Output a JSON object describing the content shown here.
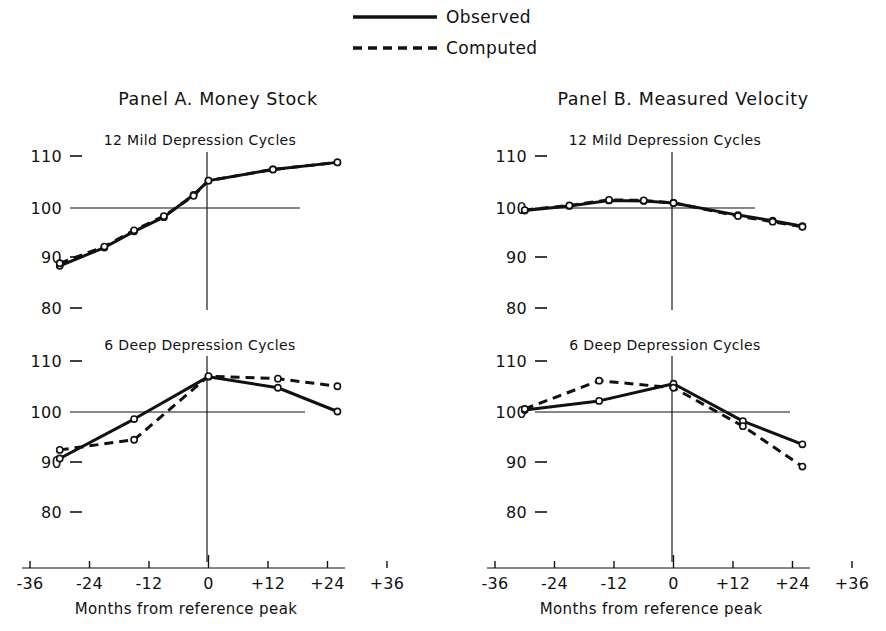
{
  "figure": {
    "legend": {
      "position": "top-center",
      "entries": [
        {
          "label": "Observed",
          "style": "solid"
        },
        {
          "label": "Computed",
          "style": "dashed"
        }
      ]
    },
    "panels": [
      {
        "id": "A",
        "title": "Panel A.  Money Stock"
      },
      {
        "id": "B",
        "title": "Panel B.  Measured Velocity"
      }
    ],
    "axis": {
      "xlabel": "Months from reference peak",
      "xticks": [
        "-36",
        "-24",
        "-12",
        "0",
        "+12",
        "+24",
        "+36"
      ],
      "xtick_values": [
        -36,
        -24,
        -12,
        0,
        12,
        24,
        36
      ],
      "yticks": [
        "110",
        "100",
        "90",
        "80"
      ],
      "ytick_values": [
        110,
        100,
        90,
        80
      ],
      "ylim": [
        75,
        114
      ],
      "xlim": [
        -36,
        36
      ],
      "reference_level": 100,
      "grid": false
    },
    "colors": {
      "ink": "#111111",
      "background": "#ffffff",
      "marker_fill": "#ffffff"
    }
  },
  "chart_data": [
    {
      "id": "panelA-mild",
      "type": "line",
      "panel": "Panel A.  Money Stock",
      "title": "12 Mild Depression Cycles",
      "xlabel": "Months from reference peak",
      "ylabel": "",
      "xlim": [
        -36,
        36
      ],
      "ylim": [
        75,
        114
      ],
      "xticks": [
        -36,
        -24,
        -12,
        0,
        12,
        24,
        36
      ],
      "yticks": [
        110,
        100,
        90,
        80
      ],
      "grid": false,
      "reference_level": 100,
      "series": [
        {
          "name": "Observed",
          "style": "solid",
          "x": [
            -30,
            -21,
            -15,
            -9,
            -3,
            0,
            13,
            26
          ],
          "values": [
            88.6,
            92.2,
            95.4,
            98.2,
            102.6,
            105.4,
            107.6,
            109.0
          ]
        },
        {
          "name": "Computed",
          "style": "dashed",
          "x": [
            -30,
            -21,
            -15,
            -9,
            -3,
            0,
            13,
            26
          ],
          "values": [
            89.1,
            92.4,
            95.6,
            98.4,
            102.4,
            105.4,
            107.6,
            109.0
          ]
        }
      ]
    },
    {
      "id": "panelA-deep",
      "type": "line",
      "panel": "Panel A.  Money Stock",
      "title": "6 Deep Depression Cycles",
      "xlabel": "Months from reference peak",
      "ylabel": "",
      "xlim": [
        -36,
        36
      ],
      "ylim": [
        75,
        114
      ],
      "xticks": [
        -36,
        -24,
        -12,
        0,
        12,
        24,
        36
      ],
      "yticks": [
        110,
        100,
        90,
        80
      ],
      "grid": false,
      "reference_level": 100,
      "series": [
        {
          "name": "Observed",
          "style": "solid",
          "x": [
            -30,
            -15,
            0,
            14,
            26
          ],
          "values": [
            90.8,
            98.6,
            107.0,
            104.8,
            100.1
          ]
        },
        {
          "name": "Computed",
          "style": "dashed",
          "x": [
            -30,
            -15,
            0,
            14,
            26
          ],
          "values": [
            92.5,
            94.5,
            107.1,
            106.6,
            105.1
          ]
        }
      ]
    },
    {
      "id": "panelB-mild",
      "type": "line",
      "panel": "Panel B.  Measured Velocity",
      "title": "12 Mild Depression Cycles",
      "xlabel": "Months from reference peak",
      "ylabel": "",
      "xlim": [
        -36,
        36
      ],
      "ylim": [
        75,
        114
      ],
      "xticks": [
        -36,
        -24,
        -12,
        0,
        12,
        24,
        36
      ],
      "yticks": [
        110,
        100,
        90,
        80
      ],
      "grid": false,
      "reference_level": 100,
      "series": [
        {
          "name": "Observed",
          "style": "solid",
          "x": [
            -30,
            -21,
            -13,
            -6,
            0,
            13,
            20,
            26
          ],
          "values": [
            99.5,
            100.4,
            101.5,
            101.4,
            101.0,
            98.6,
            97.5,
            96.4
          ]
        },
        {
          "name": "Computed",
          "style": "dashed",
          "x": [
            -30,
            -21,
            -13,
            -6,
            0,
            13,
            20,
            26
          ],
          "values": [
            99.6,
            100.5,
            101.6,
            101.5,
            101.0,
            98.4,
            97.3,
            96.3
          ]
        }
      ]
    },
    {
      "id": "panelB-deep",
      "type": "line",
      "panel": "Panel B.  Measured Velocity",
      "title": "6 Deep Depression Cycles",
      "xlabel": "Months from reference peak",
      "ylabel": "",
      "xlim": [
        -36,
        36
      ],
      "ylim": [
        75,
        114
      ],
      "xticks": [
        -36,
        -24,
        -12,
        0,
        12,
        24,
        36
      ],
      "yticks": [
        110,
        100,
        90,
        80
      ],
      "grid": false,
      "reference_level": 100,
      "series": [
        {
          "name": "Observed",
          "style": "solid",
          "x": [
            -30,
            -15,
            0,
            14,
            26
          ],
          "values": [
            100.4,
            102.2,
            105.6,
            98.2,
            93.6
          ]
        },
        {
          "name": "Computed",
          "style": "dashed",
          "x": [
            -30,
            -15,
            0,
            14,
            26
          ],
          "values": [
            100.6,
            106.2,
            104.8,
            97.2,
            89.2
          ]
        }
      ]
    }
  ]
}
